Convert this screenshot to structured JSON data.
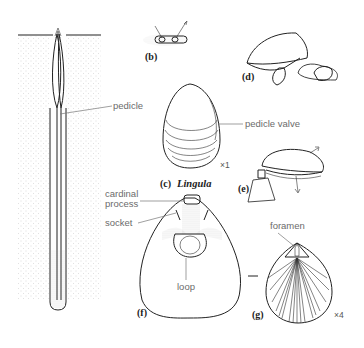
{
  "figure": {
    "panels": {
      "a": {
        "label": "",
        "labels": {
          "pedicle": "pedicle"
        }
      },
      "b": {
        "label": "(b)"
      },
      "c": {
        "label": "(c)",
        "genus": "Lingula",
        "labels": {
          "pedicle_valve": "pedicle valve"
        },
        "scale": "×1"
      },
      "d": {
        "label": "(d)"
      },
      "e": {
        "label": "(e)"
      },
      "f": {
        "label": "(f)",
        "labels": {
          "cardinal_process_1": "cardinal",
          "cardinal_process_2": "process",
          "socket": "socket",
          "loop": "loop"
        }
      },
      "g": {
        "label": "(g)",
        "labels": {
          "foramen": "foramen"
        },
        "scale": "×4"
      }
    },
    "colors": {
      "ink": "#222222",
      "label_gray": "#6b6b6b",
      "sediment_dot": "#b5b5b5"
    }
  }
}
